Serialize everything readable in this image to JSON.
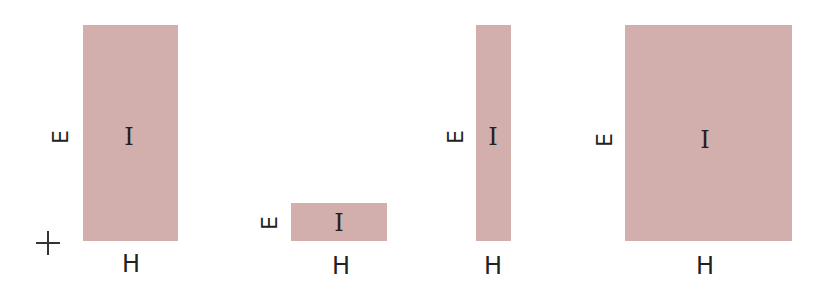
{
  "diagram": {
    "fill_color": "#d2afac",
    "origin_marker": "crosshair-icon",
    "rectangles": [
      {
        "id": "tall-medium",
        "center_label": "I",
        "width_label": "H",
        "height_label": "E",
        "x": 83,
        "y": 25,
        "w": 95,
        "h": 216
      },
      {
        "id": "short-wide",
        "center_label": "I",
        "width_label": "H",
        "height_label": "E",
        "x": 291,
        "y": 203,
        "w": 96,
        "h": 38
      },
      {
        "id": "tall-narrow",
        "center_label": "I",
        "width_label": "H",
        "height_label": "E",
        "x": 476,
        "y": 25,
        "w": 35,
        "h": 216
      },
      {
        "id": "tall-wide",
        "center_label": "I",
        "width_label": "H",
        "height_label": "E",
        "x": 625,
        "y": 25,
        "w": 167,
        "h": 216
      }
    ]
  }
}
